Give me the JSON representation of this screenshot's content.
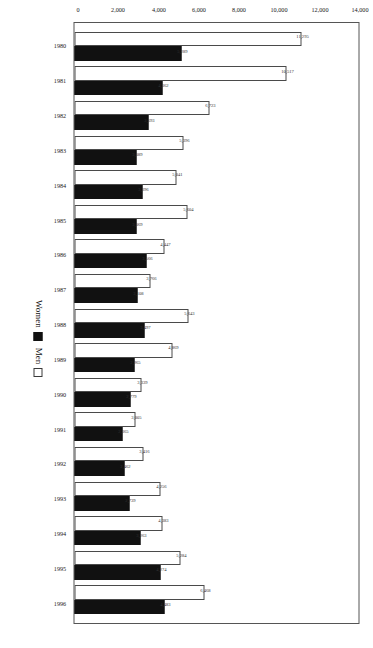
{
  "chart_data": {
    "type": "bar",
    "title": "",
    "subtitle": "",
    "xlabel": "",
    "ylabel": "",
    "orientation": "vertical-rotated",
    "grid": false,
    "legend_position": "bottom-right",
    "ylim": [
      0,
      14000
    ],
    "yticks": [
      "0",
      "2,000",
      "4,000",
      "6,000",
      "8,000",
      "10,000",
      "12,000",
      "14,000"
    ],
    "ytick_values": [
      0,
      2000,
      4000,
      6000,
      8000,
      10000,
      12000,
      14000
    ],
    "categories": [
      "1980",
      "1981",
      "1982",
      "1983",
      "1984",
      "1985",
      "1986",
      "1987",
      "1988",
      "1989",
      "1990",
      "1991",
      "1992",
      "1993",
      "1994",
      "1995",
      "1996"
    ],
    "series": [
      {
        "name": "Men",
        "color": "#ffffff",
        "values": [
          11295,
          10517,
          6723,
          5396,
          5041,
          5604,
          4447,
          3766,
          5643,
          4869,
          3339,
          3005,
          3416,
          4256,
          4383,
          5284,
          6468
        ],
        "labels": [
          "11,295",
          "10,517",
          "6,723",
          "5,396",
          "5,041",
          "5,604",
          "4,447",
          "3,766",
          "5,643",
          "4,869",
          "3,339",
          "3,005",
          "3,416",
          "4,256",
          "4,383",
          "5,284",
          "6,468"
        ]
      },
      {
        "name": "Women",
        "color": "#111111",
        "values": [
          5289,
          4362,
          3693,
          3089,
          3396,
          3069,
          3566,
          3108,
          3497,
          2965,
          2779,
          2365,
          2462,
          2739,
          3263,
          4274,
          4483
        ],
        "labels": [
          "5,289",
          "4,362",
          "3,693",
          "3,089",
          "3,396",
          "3,069",
          "3,566",
          "3,108",
          "3,497",
          "2,965",
          "2,779",
          "2,365",
          "2,462",
          "2,739",
          "3,263",
          "4,274",
          "4,483"
        ]
      }
    ]
  },
  "legend": {
    "items": [
      {
        "label": "Women",
        "swatch": "filled-black-square",
        "key": "women"
      },
      {
        "label": "Men",
        "swatch": "hollow-white-square",
        "key": "men"
      }
    ]
  }
}
